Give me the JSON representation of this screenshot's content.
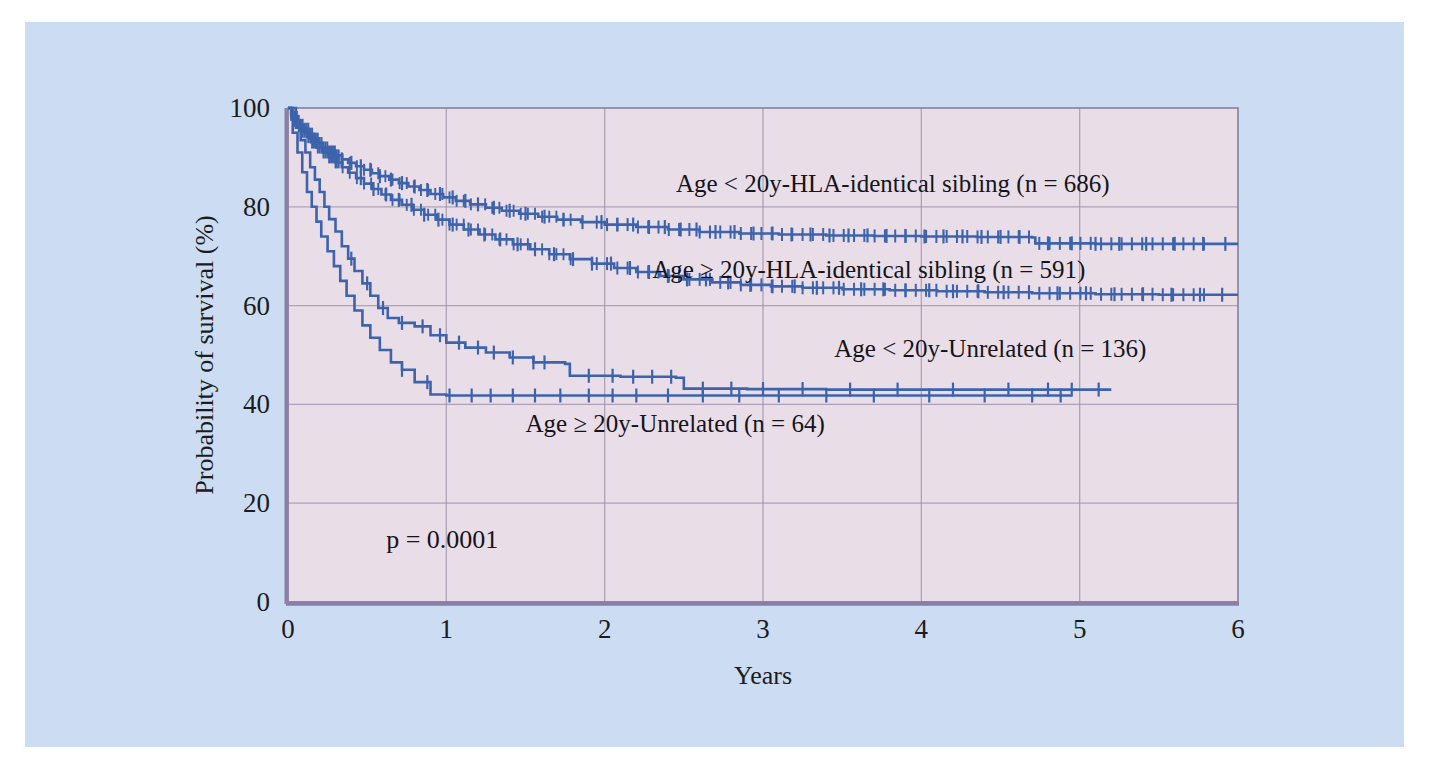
{
  "figure": {
    "background_color": "#ccdcf2",
    "plot_background_color": "#e9dde8",
    "grid_color": "#9b8fa8",
    "frame_color": "#8a7f99",
    "curve_color": "#3c63ab",
    "text_color": "#14141a"
  },
  "chart_data": {
    "type": "line",
    "subtype": "kaplan-meier-survival",
    "title": "",
    "xlabel": "Years",
    "ylabel": "Probability of survival (%)",
    "xlim": [
      0,
      6
    ],
    "ylim": [
      0,
      100
    ],
    "xticks": [
      0,
      1,
      2,
      3,
      4,
      5,
      6
    ],
    "xtick_labels": [
      "0",
      "1",
      "2",
      "3",
      "4",
      "5",
      "6"
    ],
    "yticks": [
      0,
      20,
      40,
      60,
      80,
      100
    ],
    "ytick_labels": [
      "0",
      "20",
      "40",
      "60",
      "80",
      "100"
    ],
    "grid": true,
    "legend_position": "inline-annotations",
    "annotations": [
      {
        "text": "p = 0.0001",
        "x": 0.62,
        "y": 11
      }
    ],
    "series": [
      {
        "name": "Age < 20y-HLA-identical sibling (n = 686)",
        "label": "Age < 20y-HLA-identical sibling (n = 686)",
        "n": 686,
        "color": "#3c63ab",
        "label_x": 2.45,
        "label_y": 83,
        "final_value": 72.5,
        "points": [
          [
            0.0,
            100.0
          ],
          [
            0.02,
            99.0
          ],
          [
            0.04,
            98.2
          ],
          [
            0.06,
            97.4
          ],
          [
            0.08,
            96.6
          ],
          [
            0.1,
            95.8
          ],
          [
            0.13,
            94.8
          ],
          [
            0.16,
            93.8
          ],
          [
            0.19,
            92.9
          ],
          [
            0.22,
            92.0
          ],
          [
            0.26,
            91.2
          ],
          [
            0.3,
            90.4
          ],
          [
            0.34,
            89.6
          ],
          [
            0.38,
            88.9
          ],
          [
            0.43,
            88.2
          ],
          [
            0.48,
            87.5
          ],
          [
            0.53,
            86.8
          ],
          [
            0.58,
            86.2
          ],
          [
            0.64,
            85.5
          ],
          [
            0.7,
            84.8
          ],
          [
            0.76,
            84.1
          ],
          [
            0.83,
            83.4
          ],
          [
            0.9,
            82.6
          ],
          [
            0.98,
            81.9
          ],
          [
            1.06,
            81.2
          ],
          [
            1.15,
            80.5
          ],
          [
            1.25,
            79.8
          ],
          [
            1.35,
            79.2
          ],
          [
            1.46,
            78.6
          ],
          [
            1.58,
            78.0
          ],
          [
            1.7,
            77.4
          ],
          [
            1.85,
            76.9
          ],
          [
            2.0,
            76.4
          ],
          [
            2.2,
            75.9
          ],
          [
            2.4,
            75.4
          ],
          [
            2.6,
            74.9
          ],
          [
            2.85,
            74.6
          ],
          [
            3.1,
            74.4
          ],
          [
            3.4,
            74.2
          ],
          [
            3.7,
            74.1
          ],
          [
            4.0,
            74.0
          ],
          [
            4.35,
            73.9
          ],
          [
            4.7,
            73.8
          ],
          [
            4.72,
            72.6
          ],
          [
            5.1,
            72.5
          ],
          [
            5.5,
            72.5
          ],
          [
            6.0,
            72.5
          ]
        ],
        "censor_marks": [
          0.34,
          0.4,
          0.46,
          0.52,
          0.58,
          0.65,
          0.72,
          0.8,
          0.88,
          0.96,
          1.04,
          1.12,
          1.2,
          1.3,
          1.4,
          1.5,
          1.62,
          1.74,
          1.86,
          1.98,
          2.08,
          2.18,
          2.28,
          2.38,
          2.48,
          2.58,
          2.7,
          2.82,
          2.94,
          3.06,
          3.18,
          3.3,
          3.42,
          3.54,
          3.66,
          3.78,
          3.9,
          4.02,
          4.14,
          4.26,
          4.38,
          4.5,
          4.62,
          4.8,
          4.95,
          5.1,
          5.25,
          5.42,
          5.6,
          5.78,
          5.92
        ]
      },
      {
        "name": "Age ≥ 20y-HLA-identical sibling (n = 591)",
        "label": "Age ≥ 20y-HLA-identical sibling (n = 591)",
        "n": 591,
        "color": "#3c63ab",
        "label_x": 2.3,
        "label_y": 65.5,
        "final_value": 62.2,
        "points": [
          [
            0.0,
            100.0
          ],
          [
            0.02,
            98.6
          ],
          [
            0.04,
            97.4
          ],
          [
            0.06,
            96.3
          ],
          [
            0.09,
            95.2
          ],
          [
            0.12,
            94.1
          ],
          [
            0.15,
            93.0
          ],
          [
            0.18,
            92.0
          ],
          [
            0.22,
            91.0
          ],
          [
            0.26,
            90.0
          ],
          [
            0.3,
            89.0
          ],
          [
            0.34,
            88.0
          ],
          [
            0.38,
            86.9
          ],
          [
            0.43,
            85.8
          ],
          [
            0.48,
            84.7
          ],
          [
            0.53,
            83.6
          ],
          [
            0.59,
            82.5
          ],
          [
            0.65,
            81.4
          ],
          [
            0.72,
            80.4
          ],
          [
            0.79,
            79.4
          ],
          [
            0.86,
            78.4
          ],
          [
            0.94,
            77.4
          ],
          [
            1.02,
            76.4
          ],
          [
            1.11,
            75.4
          ],
          [
            1.21,
            74.4
          ],
          [
            1.31,
            73.4
          ],
          [
            1.42,
            72.4
          ],
          [
            1.53,
            71.4
          ],
          [
            1.65,
            70.4
          ],
          [
            1.78,
            69.4
          ],
          [
            1.92,
            68.5
          ],
          [
            2.06,
            67.6
          ],
          [
            2.2,
            66.8
          ],
          [
            2.35,
            66.0
          ],
          [
            2.5,
            65.3
          ],
          [
            2.68,
            64.7
          ],
          [
            2.86,
            64.2
          ],
          [
            3.05,
            63.9
          ],
          [
            3.25,
            63.6
          ],
          [
            3.5,
            63.3
          ],
          [
            3.8,
            63.1
          ],
          [
            4.1,
            62.9
          ],
          [
            4.4,
            62.7
          ],
          [
            4.7,
            62.5
          ],
          [
            5.1,
            62.3
          ],
          [
            5.5,
            62.2
          ],
          [
            6.0,
            62.2
          ]
        ],
        "censor_marks": [
          0.46,
          0.54,
          0.62,
          0.7,
          0.78,
          0.86,
          0.95,
          1.04,
          1.14,
          1.24,
          1.34,
          1.45,
          1.56,
          1.68,
          1.8,
          1.92,
          2.04,
          2.16,
          2.28,
          2.4,
          2.52,
          2.64,
          2.78,
          2.92,
          3.06,
          3.2,
          3.34,
          3.48,
          3.62,
          3.76,
          3.9,
          4.05,
          4.2,
          4.36,
          4.52,
          4.68,
          4.86,
          5.04,
          5.22,
          5.4,
          5.58,
          5.76,
          5.9
        ]
      },
      {
        "name": "Age < 20y-Unrelated (n = 136)",
        "label": "Age < 20y-Unrelated (n = 136)",
        "n": 136,
        "color": "#3c63ab",
        "label_x": 3.45,
        "label_y": 49.5,
        "final_value": 43.0,
        "points": [
          [
            0.0,
            100.0
          ],
          [
            0.05,
            96.0
          ],
          [
            0.08,
            93.5
          ],
          [
            0.11,
            91.0
          ],
          [
            0.14,
            88.0
          ],
          [
            0.17,
            85.5
          ],
          [
            0.2,
            83.0
          ],
          [
            0.23,
            80.0
          ],
          [
            0.26,
            77.5
          ],
          [
            0.3,
            75.0
          ],
          [
            0.34,
            72.0
          ],
          [
            0.38,
            69.5
          ],
          [
            0.42,
            67.0
          ],
          [
            0.47,
            64.5
          ],
          [
            0.52,
            62.0
          ],
          [
            0.57,
            59.5
          ],
          [
            0.63,
            57.5
          ],
          [
            0.7,
            56.5
          ],
          [
            0.8,
            55.8
          ],
          [
            0.9,
            54.0
          ],
          [
            1.0,
            52.5
          ],
          [
            1.12,
            51.5
          ],
          [
            1.25,
            50.5
          ],
          [
            1.4,
            49.5
          ],
          [
            1.55,
            48.5
          ],
          [
            1.75,
            48.2
          ],
          [
            1.78,
            45.8
          ],
          [
            2.1,
            45.6
          ],
          [
            2.45,
            45.4
          ],
          [
            2.5,
            43.2
          ],
          [
            2.9,
            43.1
          ],
          [
            3.4,
            43.0
          ],
          [
            3.9,
            43.0
          ],
          [
            4.4,
            43.0
          ],
          [
            4.9,
            43.0
          ],
          [
            5.2,
            43.0
          ]
        ],
        "censor_marks": [
          0.4,
          0.5,
          0.6,
          0.72,
          0.85,
          0.96,
          1.08,
          1.2,
          1.3,
          1.42,
          1.55,
          1.62,
          1.9,
          2.05,
          2.18,
          2.3,
          2.42,
          2.62,
          2.8,
          3.0,
          3.25,
          3.55,
          3.85,
          4.2,
          4.55,
          4.8,
          4.95,
          5.12
        ]
      },
      {
        "name": "Age ≥ 20y-Unrelated (n = 64)",
        "label": "Age ≥ 20y-Unrelated (n = 64)",
        "n": 64,
        "color": "#3c63ab",
        "label_x": 1.5,
        "label_y": 34.5,
        "final_value": 41.8,
        "points": [
          [
            0.0,
            100.0
          ],
          [
            0.03,
            95.0
          ],
          [
            0.06,
            91.0
          ],
          [
            0.09,
            87.0
          ],
          [
            0.12,
            83.0
          ],
          [
            0.15,
            80.0
          ],
          [
            0.18,
            77.0
          ],
          [
            0.21,
            74.0
          ],
          [
            0.25,
            71.0
          ],
          [
            0.29,
            68.0
          ],
          [
            0.33,
            65.0
          ],
          [
            0.37,
            62.0
          ],
          [
            0.42,
            59.0
          ],
          [
            0.47,
            56.0
          ],
          [
            0.52,
            53.5
          ],
          [
            0.58,
            51.0
          ],
          [
            0.65,
            48.5
          ],
          [
            0.72,
            47.0
          ],
          [
            0.8,
            44.5
          ],
          [
            0.9,
            42.0
          ],
          [
            1.0,
            41.8
          ],
          [
            1.4,
            41.8
          ],
          [
            1.9,
            41.8
          ],
          [
            2.4,
            41.8
          ],
          [
            2.9,
            41.8
          ],
          [
            3.4,
            41.8
          ],
          [
            3.9,
            41.8
          ],
          [
            4.4,
            41.8
          ],
          [
            4.8,
            41.8
          ],
          [
            4.95,
            41.8
          ]
        ],
        "censor_marks": [
          0.72,
          0.88,
          1.02,
          1.16,
          1.28,
          1.42,
          1.56,
          1.72,
          1.9,
          2.05,
          2.2,
          2.4,
          2.62,
          2.85,
          3.1,
          3.4,
          3.7,
          4.05,
          4.4,
          4.7,
          4.88
        ]
      }
    ]
  }
}
